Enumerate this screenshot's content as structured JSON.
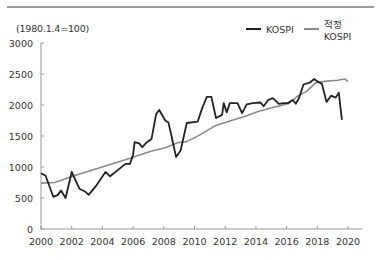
{
  "chart_data": {
    "type": "line",
    "title": "",
    "unit_label": "(1980.1.4=100)",
    "xlabel": "",
    "ylabel": "",
    "xlim": [
      2000,
      2021
    ],
    "ylim": [
      0,
      3000
    ],
    "grid": false,
    "legend_position": "top-right",
    "x_ticks": [
      "2000",
      "2002",
      "2004",
      "2006",
      "2008",
      "2010",
      "2012",
      "2014",
      "2016",
      "2018",
      "2020"
    ],
    "y_ticks": [
      "0",
      "500",
      "1000",
      "1500",
      "2000",
      "2500",
      "3000"
    ],
    "series": [
      {
        "name": "KOSPI",
        "color": "#222222",
        "points": [
          [
            2000.0,
            900
          ],
          [
            2000.3,
            860
          ],
          [
            2000.8,
            520
          ],
          [
            2001.1,
            550
          ],
          [
            2001.3,
            620
          ],
          [
            2001.6,
            500
          ],
          [
            2002.0,
            920
          ],
          [
            2002.5,
            650
          ],
          [
            2002.9,
            600
          ],
          [
            2003.1,
            550
          ],
          [
            2003.6,
            700
          ],
          [
            2004.2,
            920
          ],
          [
            2004.5,
            850
          ],
          [
            2005.0,
            950
          ],
          [
            2005.5,
            1050
          ],
          [
            2005.8,
            1050
          ],
          [
            2006.0,
            1200
          ],
          [
            2006.1,
            1400
          ],
          [
            2006.4,
            1380
          ],
          [
            2006.6,
            1320
          ],
          [
            2006.9,
            1400
          ],
          [
            2007.2,
            1450
          ],
          [
            2007.5,
            1850
          ],
          [
            2007.7,
            1920
          ],
          [
            2008.1,
            1750
          ],
          [
            2008.3,
            1720
          ],
          [
            2008.5,
            1500
          ],
          [
            2008.8,
            1160
          ],
          [
            2009.1,
            1270
          ],
          [
            2009.5,
            1710
          ],
          [
            2010.2,
            1730
          ],
          [
            2010.5,
            1950
          ],
          [
            2010.8,
            2130
          ],
          [
            2011.1,
            2130
          ],
          [
            2011.4,
            1790
          ],
          [
            2011.8,
            1840
          ],
          [
            2011.9,
            2030
          ],
          [
            2012.1,
            1880
          ],
          [
            2012.3,
            2030
          ],
          [
            2012.8,
            2030
          ],
          [
            2013.1,
            1870
          ],
          [
            2013.4,
            2010
          ],
          [
            2013.8,
            2030
          ],
          [
            2014.3,
            2040
          ],
          [
            2014.5,
            1980
          ],
          [
            2014.8,
            2080
          ],
          [
            2015.1,
            2110
          ],
          [
            2015.5,
            2020
          ],
          [
            2015.8,
            2030
          ],
          [
            2016.1,
            2030
          ],
          [
            2016.4,
            2080
          ],
          [
            2016.6,
            2020
          ],
          [
            2016.8,
            2110
          ],
          [
            2017.1,
            2330
          ],
          [
            2017.5,
            2360
          ],
          [
            2017.8,
            2420
          ],
          [
            2018.0,
            2380
          ],
          [
            2018.3,
            2340
          ],
          [
            2018.6,
            2050
          ],
          [
            2018.9,
            2150
          ],
          [
            2019.2,
            2120
          ],
          [
            2019.4,
            2200
          ],
          [
            2019.6,
            1760
          ]
        ]
      },
      {
        "name": "적정 KOSPI",
        "color": "#8a8a8a",
        "points": [
          [
            2000.0,
            740
          ],
          [
            2000.9,
            750
          ],
          [
            2001.9,
            840
          ],
          [
            2003.2,
            940
          ],
          [
            2004.5,
            1040
          ],
          [
            2005.8,
            1140
          ],
          [
            2007.1,
            1250
          ],
          [
            2008.1,
            1310
          ],
          [
            2008.9,
            1390
          ],
          [
            2009.5,
            1410
          ],
          [
            2010.3,
            1510
          ],
          [
            2011.3,
            1660
          ],
          [
            2012.3,
            1740
          ],
          [
            2013.3,
            1820
          ],
          [
            2014.1,
            1890
          ],
          [
            2015.1,
            1960
          ],
          [
            2016.1,
            2020
          ],
          [
            2016.7,
            2140
          ],
          [
            2017.3,
            2220
          ],
          [
            2017.9,
            2360
          ],
          [
            2018.5,
            2380
          ],
          [
            2019.3,
            2400
          ],
          [
            2019.8,
            2420
          ],
          [
            2020.0,
            2380
          ]
        ]
      }
    ]
  },
  "legend": {
    "items": [
      {
        "label": "KOSPI",
        "color": "#222222"
      },
      {
        "label": "적정 KOSPI",
        "color": "#8a8a8a"
      }
    ]
  }
}
